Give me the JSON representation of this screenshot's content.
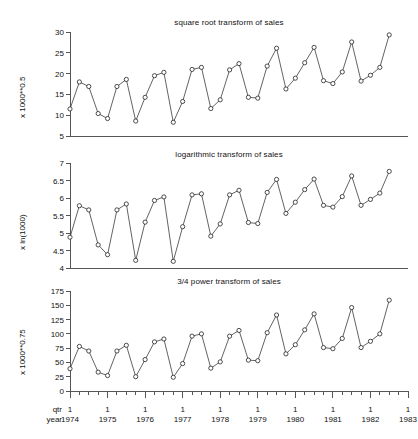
{
  "figure": {
    "background": "#ffffff",
    "line_color": "#3b3b3b",
    "marker_color": "#ffffff",
    "marker_edge_color": "#222222",
    "axis_color": "#555555"
  },
  "xaxis": {
    "row_label_qtr": "qtr",
    "row_label_year": "year",
    "quarter_tick_label": "1",
    "year_labels": [
      "1974",
      "1975",
      "1976",
      "1977",
      "1978",
      "1979",
      "1980",
      "1981",
      "1982",
      "1983"
    ],
    "quarter_labels": [
      "1",
      "1",
      "1",
      "1",
      "1",
      "1",
      "1",
      "1",
      "1",
      "1"
    ],
    "minor_ticks_per_year": 4
  },
  "chart_data": [
    {
      "type": "line",
      "title": "square root transform of sales",
      "xlabel": "",
      "ylabel": "x 1000**0.5",
      "ylim": [
        5,
        30
      ],
      "yticks": [
        5,
        10,
        15,
        20,
        25,
        30
      ],
      "ytick_labels": [
        "5",
        "10",
        "15",
        "20",
        "25",
        "30"
      ],
      "grid": false,
      "legend": false,
      "x": [
        "1974Q1",
        "1974Q2",
        "1974Q3",
        "1974Q4",
        "1975Q1",
        "1975Q2",
        "1975Q3",
        "1975Q4",
        "1976Q1",
        "1976Q2",
        "1976Q3",
        "1976Q4",
        "1977Q1",
        "1977Q2",
        "1977Q3",
        "1977Q4",
        "1978Q1",
        "1978Q2",
        "1978Q3",
        "1978Q4",
        "1979Q1",
        "1979Q2",
        "1979Q3",
        "1979Q4",
        "1980Q1",
        "1980Q2",
        "1980Q3",
        "1980Q4",
        "1981Q1",
        "1981Q2",
        "1981Q3",
        "1981Q4",
        "1982Q1",
        "1982Q2",
        "1982Q3"
      ],
      "values": [
        11.5,
        18.0,
        16.9,
        10.4,
        9.2,
        16.9,
        18.6,
        8.6,
        14.3,
        19.5,
        20.3,
        8.3,
        13.3,
        21.0,
        21.5,
        11.6,
        13.7,
        20.9,
        22.4,
        14.3,
        14.1,
        21.8,
        26.1,
        16.3,
        18.9,
        22.6,
        26.3,
        18.3,
        17.6,
        20.4,
        27.6,
        18.2,
        19.6,
        21.5,
        29.3
      ]
    },
    {
      "type": "line",
      "title": "logarithmic transform of sales",
      "xlabel": "",
      "ylabel": "x ln(1000)",
      "ylim": [
        4,
        7
      ],
      "yticks": [
        4,
        4.5,
        5,
        5.5,
        6,
        6.5,
        7
      ],
      "ytick_labels": [
        "4",
        "4.5",
        "5",
        "5.5",
        "6",
        "6.5",
        "7"
      ],
      "grid": false,
      "legend": false,
      "x": [
        "1974Q1",
        "1974Q2",
        "1974Q3",
        "1974Q4",
        "1975Q1",
        "1975Q2",
        "1975Q3",
        "1975Q4",
        "1976Q1",
        "1976Q2",
        "1976Q3",
        "1976Q4",
        "1977Q1",
        "1977Q2",
        "1977Q3",
        "1977Q4",
        "1978Q1",
        "1978Q2",
        "1978Q3",
        "1978Q4",
        "1979Q1",
        "1979Q2",
        "1979Q3",
        "1979Q4",
        "1980Q1",
        "1980Q2",
        "1980Q3",
        "1980Q4",
        "1981Q1",
        "1981Q2",
        "1981Q3",
        "1981Q4",
        "1982Q1",
        "1982Q2",
        "1982Q3"
      ],
      "values": [
        4.88,
        5.78,
        5.66,
        4.66,
        4.38,
        5.66,
        5.83,
        4.22,
        5.31,
        5.93,
        6.03,
        4.19,
        5.18,
        6.09,
        6.12,
        4.91,
        5.26,
        6.09,
        6.22,
        5.3,
        5.27,
        6.16,
        6.53,
        5.56,
        5.88,
        6.24,
        6.54,
        5.79,
        5.74,
        6.04,
        6.63,
        5.79,
        5.96,
        6.14,
        6.76
      ]
    },
    {
      "type": "line",
      "title": "3/4 power transform of sales",
      "xlabel": "",
      "ylabel": "x 1000**0.75",
      "ylim": [
        0,
        175
      ],
      "yticks": [
        0,
        25,
        50,
        75,
        100,
        125,
        150,
        175
      ],
      "ytick_labels": [
        "0",
        "25",
        "50",
        "75",
        "100",
        "125",
        "150",
        "175"
      ],
      "grid": false,
      "legend": false,
      "x": [
        "1974Q1",
        "1974Q2",
        "1974Q3",
        "1974Q4",
        "1975Q1",
        "1975Q2",
        "1975Q3",
        "1975Q4",
        "1976Q1",
        "1976Q2",
        "1976Q3",
        "1976Q4",
        "1977Q1",
        "1977Q2",
        "1977Q3",
        "1977Q4",
        "1978Q1",
        "1978Q2",
        "1978Q3",
        "1978Q4",
        "1979Q1",
        "1979Q2",
        "1979Q3",
        "1979Q4",
        "1980Q1",
        "1980Q2",
        "1980Q3",
        "1980Q4",
        "1981Q1",
        "1981Q2",
        "1981Q3",
        "1981Q4",
        "1982Q1",
        "1982Q2",
        "1982Q3"
      ],
      "values": [
        39,
        78,
        70,
        33,
        27,
        70,
        80,
        25,
        55,
        86,
        91,
        24,
        48,
        96,
        100,
        40,
        51,
        96,
        106,
        54,
        53,
        102,
        133,
        65,
        81,
        107,
        135,
        76,
        74,
        92,
        146,
        76,
        87,
        100,
        159
      ]
    }
  ]
}
